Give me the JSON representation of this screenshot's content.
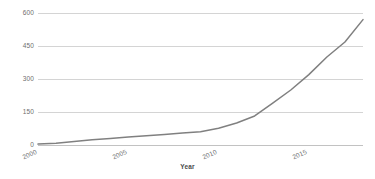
{
  "chart_data": {
    "type": "line",
    "title": "",
    "subtitle": "",
    "xlabel": "Year",
    "ylabel": "",
    "xlim": [
      2000,
      2018
    ],
    "ylim": [
      0,
      600
    ],
    "grid": true,
    "legend": false,
    "legend_position": "none",
    "line_color": "#808080",
    "grid_color": "#d4d4d4",
    "axis_color": "#c2c2c2",
    "yticks": [
      "600",
      "450",
      "300",
      "150",
      "0"
    ],
    "ytick_values": [
      600,
      450,
      300,
      150,
      0
    ],
    "xticks": [
      "2000",
      "2005",
      "2010",
      "2015"
    ],
    "xtick_values": [
      2000,
      2005,
      2010,
      2015
    ],
    "x": [
      2000,
      2001,
      2002,
      2003,
      2004,
      2005,
      2006,
      2007,
      2008,
      2009,
      2010,
      2011,
      2012,
      2013,
      2014,
      2015,
      2016,
      2017,
      2018
    ],
    "series": [
      {
        "name": "value",
        "values": [
          4,
          8,
          16,
          24,
          30,
          36,
          42,
          48,
          54,
          60,
          76,
          100,
          132,
          190,
          250,
          320,
          400,
          468,
          570
        ]
      }
    ]
  }
}
